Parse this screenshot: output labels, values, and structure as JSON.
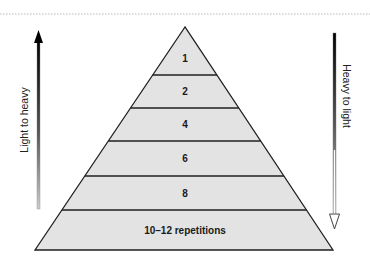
{
  "diagram": {
    "type": "pyramid",
    "colors": {
      "fill": "#e3e3e3",
      "stroke": "#1f1f1f",
      "divider_top_border": "#bdbdbd"
    },
    "layers": [
      {
        "label": "1"
      },
      {
        "label": "2"
      },
      {
        "label": "4"
      },
      {
        "label": "6"
      },
      {
        "label": "8"
      },
      {
        "label": "10–12 repetitions"
      }
    ],
    "left_arrow": {
      "label": "Light to heavy",
      "direction": "up"
    },
    "right_arrow": {
      "label": "Heavy to light",
      "direction": "down"
    }
  }
}
